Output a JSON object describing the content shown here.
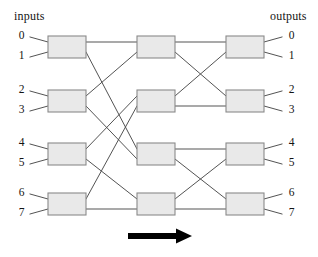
{
  "figure": {
    "header_left": "inputs",
    "header_right": "outputs",
    "flow_arrow_icon": "right-arrow-icon",
    "flow_arrow_direction": "left-to-right",
    "colors": {
      "switch_fill": "#e9e9e9",
      "switch_stroke": "#8a8a8a",
      "wire": "#4a4a4a",
      "text": "#131313",
      "arrow": "#000000",
      "background": "#ffffff"
    },
    "input_ports": [
      "0",
      "1",
      "2",
      "3",
      "4",
      "5",
      "6",
      "7"
    ],
    "output_ports": [
      "0",
      "1",
      "2",
      "3",
      "4",
      "5",
      "6",
      "7"
    ],
    "stage_count": 3,
    "switches_per_stage": 4,
    "switch_labels": [
      [
        "",
        "",
        "",
        ""
      ],
      [
        "",
        "",
        "",
        ""
      ],
      [
        "",
        "",
        "",
        ""
      ]
    ]
  },
  "geometry": {
    "width": 318,
    "height": 257,
    "box_width": 38,
    "box_height": 22,
    "stage_x": [
      48,
      137,
      226
    ],
    "row_y_top": [
      36,
      90,
      143,
      193
    ],
    "port_dy_top": 6,
    "port_dy_bottom": 16,
    "input_stub_x": 30,
    "output_stub_x": 282,
    "arrow": {
      "x1": 128,
      "x2": 192,
      "y": 236,
      "thickness": 6,
      "head_width": 16,
      "head_height": 15
    }
  },
  "chart_data": {
    "type": "diagram",
    "diagram_kind": "multistage-interconnection-network",
    "nodes": [
      {
        "id": "s0-0",
        "stage": 0,
        "row": 0
      },
      {
        "id": "s0-1",
        "stage": 0,
        "row": 1
      },
      {
        "id": "s0-2",
        "stage": 0,
        "row": 2
      },
      {
        "id": "s0-3",
        "stage": 0,
        "row": 3
      },
      {
        "id": "s1-0",
        "stage": 1,
        "row": 0
      },
      {
        "id": "s1-1",
        "stage": 1,
        "row": 1
      },
      {
        "id": "s1-2",
        "stage": 1,
        "row": 2
      },
      {
        "id": "s1-3",
        "stage": 1,
        "row": 3
      },
      {
        "id": "s2-0",
        "stage": 2,
        "row": 0
      },
      {
        "id": "s2-1",
        "stage": 2,
        "row": 1
      },
      {
        "id": "s2-2",
        "stage": 2,
        "row": 2
      },
      {
        "id": "s2-3",
        "stage": 2,
        "row": 3
      }
    ],
    "stage0_to_stage1": [
      {
        "from": "s0-0",
        "from_port": "top",
        "to": "s1-0",
        "to_port": "top"
      },
      {
        "from": "s0-0",
        "from_port": "bottom",
        "to": "s1-2",
        "to_port": "top"
      },
      {
        "from": "s0-1",
        "from_port": "top",
        "to": "s1-0",
        "to_port": "bottom"
      },
      {
        "from": "s0-1",
        "from_port": "bottom",
        "to": "s1-2",
        "to_port": "bottom"
      },
      {
        "from": "s0-2",
        "from_port": "top",
        "to": "s1-1",
        "to_port": "top"
      },
      {
        "from": "s0-2",
        "from_port": "bottom",
        "to": "s1-3",
        "to_port": "top"
      },
      {
        "from": "s0-3",
        "from_port": "top",
        "to": "s1-1",
        "to_port": "bottom"
      },
      {
        "from": "s0-3",
        "from_port": "bottom",
        "to": "s1-3",
        "to_port": "bottom"
      }
    ],
    "stage1_to_stage2": [
      {
        "from": "s1-0",
        "from_port": "top",
        "to": "s2-0",
        "to_port": "top"
      },
      {
        "from": "s1-0",
        "from_port": "bottom",
        "to": "s2-1",
        "to_port": "top"
      },
      {
        "from": "s1-1",
        "from_port": "top",
        "to": "s2-0",
        "to_port": "bottom"
      },
      {
        "from": "s1-1",
        "from_port": "bottom",
        "to": "s2-1",
        "to_port": "bottom"
      },
      {
        "from": "s1-2",
        "from_port": "top",
        "to": "s2-2",
        "to_port": "top"
      },
      {
        "from": "s1-2",
        "from_port": "bottom",
        "to": "s2-3",
        "to_port": "top"
      },
      {
        "from": "s1-3",
        "from_port": "top",
        "to": "s2-2",
        "to_port": "bottom"
      },
      {
        "from": "s1-3",
        "from_port": "bottom",
        "to": "s2-3",
        "to_port": "bottom"
      }
    ],
    "input_edges": [
      {
        "port": "0",
        "to": "s0-0",
        "to_port": "top"
      },
      {
        "port": "1",
        "to": "s0-0",
        "to_port": "bottom"
      },
      {
        "port": "2",
        "to": "s0-1",
        "to_port": "top"
      },
      {
        "port": "3",
        "to": "s0-1",
        "to_port": "bottom"
      },
      {
        "port": "4",
        "to": "s0-2",
        "to_port": "top"
      },
      {
        "port": "5",
        "to": "s0-2",
        "to_port": "bottom"
      },
      {
        "port": "6",
        "to": "s0-3",
        "to_port": "top"
      },
      {
        "port": "7",
        "to": "s0-3",
        "to_port": "bottom"
      }
    ],
    "output_edges": [
      {
        "port": "0",
        "from": "s2-0",
        "from_port": "top"
      },
      {
        "port": "1",
        "from": "s2-0",
        "from_port": "bottom"
      },
      {
        "port": "2",
        "from": "s2-1",
        "from_port": "top"
      },
      {
        "port": "3",
        "from": "s2-1",
        "from_port": "bottom"
      },
      {
        "port": "4",
        "from": "s2-2",
        "from_port": "top"
      },
      {
        "port": "5",
        "from": "s2-2",
        "from_port": "bottom"
      },
      {
        "port": "6",
        "from": "s2-3",
        "from_port": "top"
      },
      {
        "port": "7",
        "from": "s2-3",
        "from_port": "bottom"
      }
    ],
    "annotations": [
      {
        "text": "inputs",
        "position": "top-left"
      },
      {
        "text": "outputs",
        "position": "top-right"
      },
      {
        "text": "",
        "icon": "right-arrow-icon",
        "position": "bottom-center"
      }
    ]
  }
}
